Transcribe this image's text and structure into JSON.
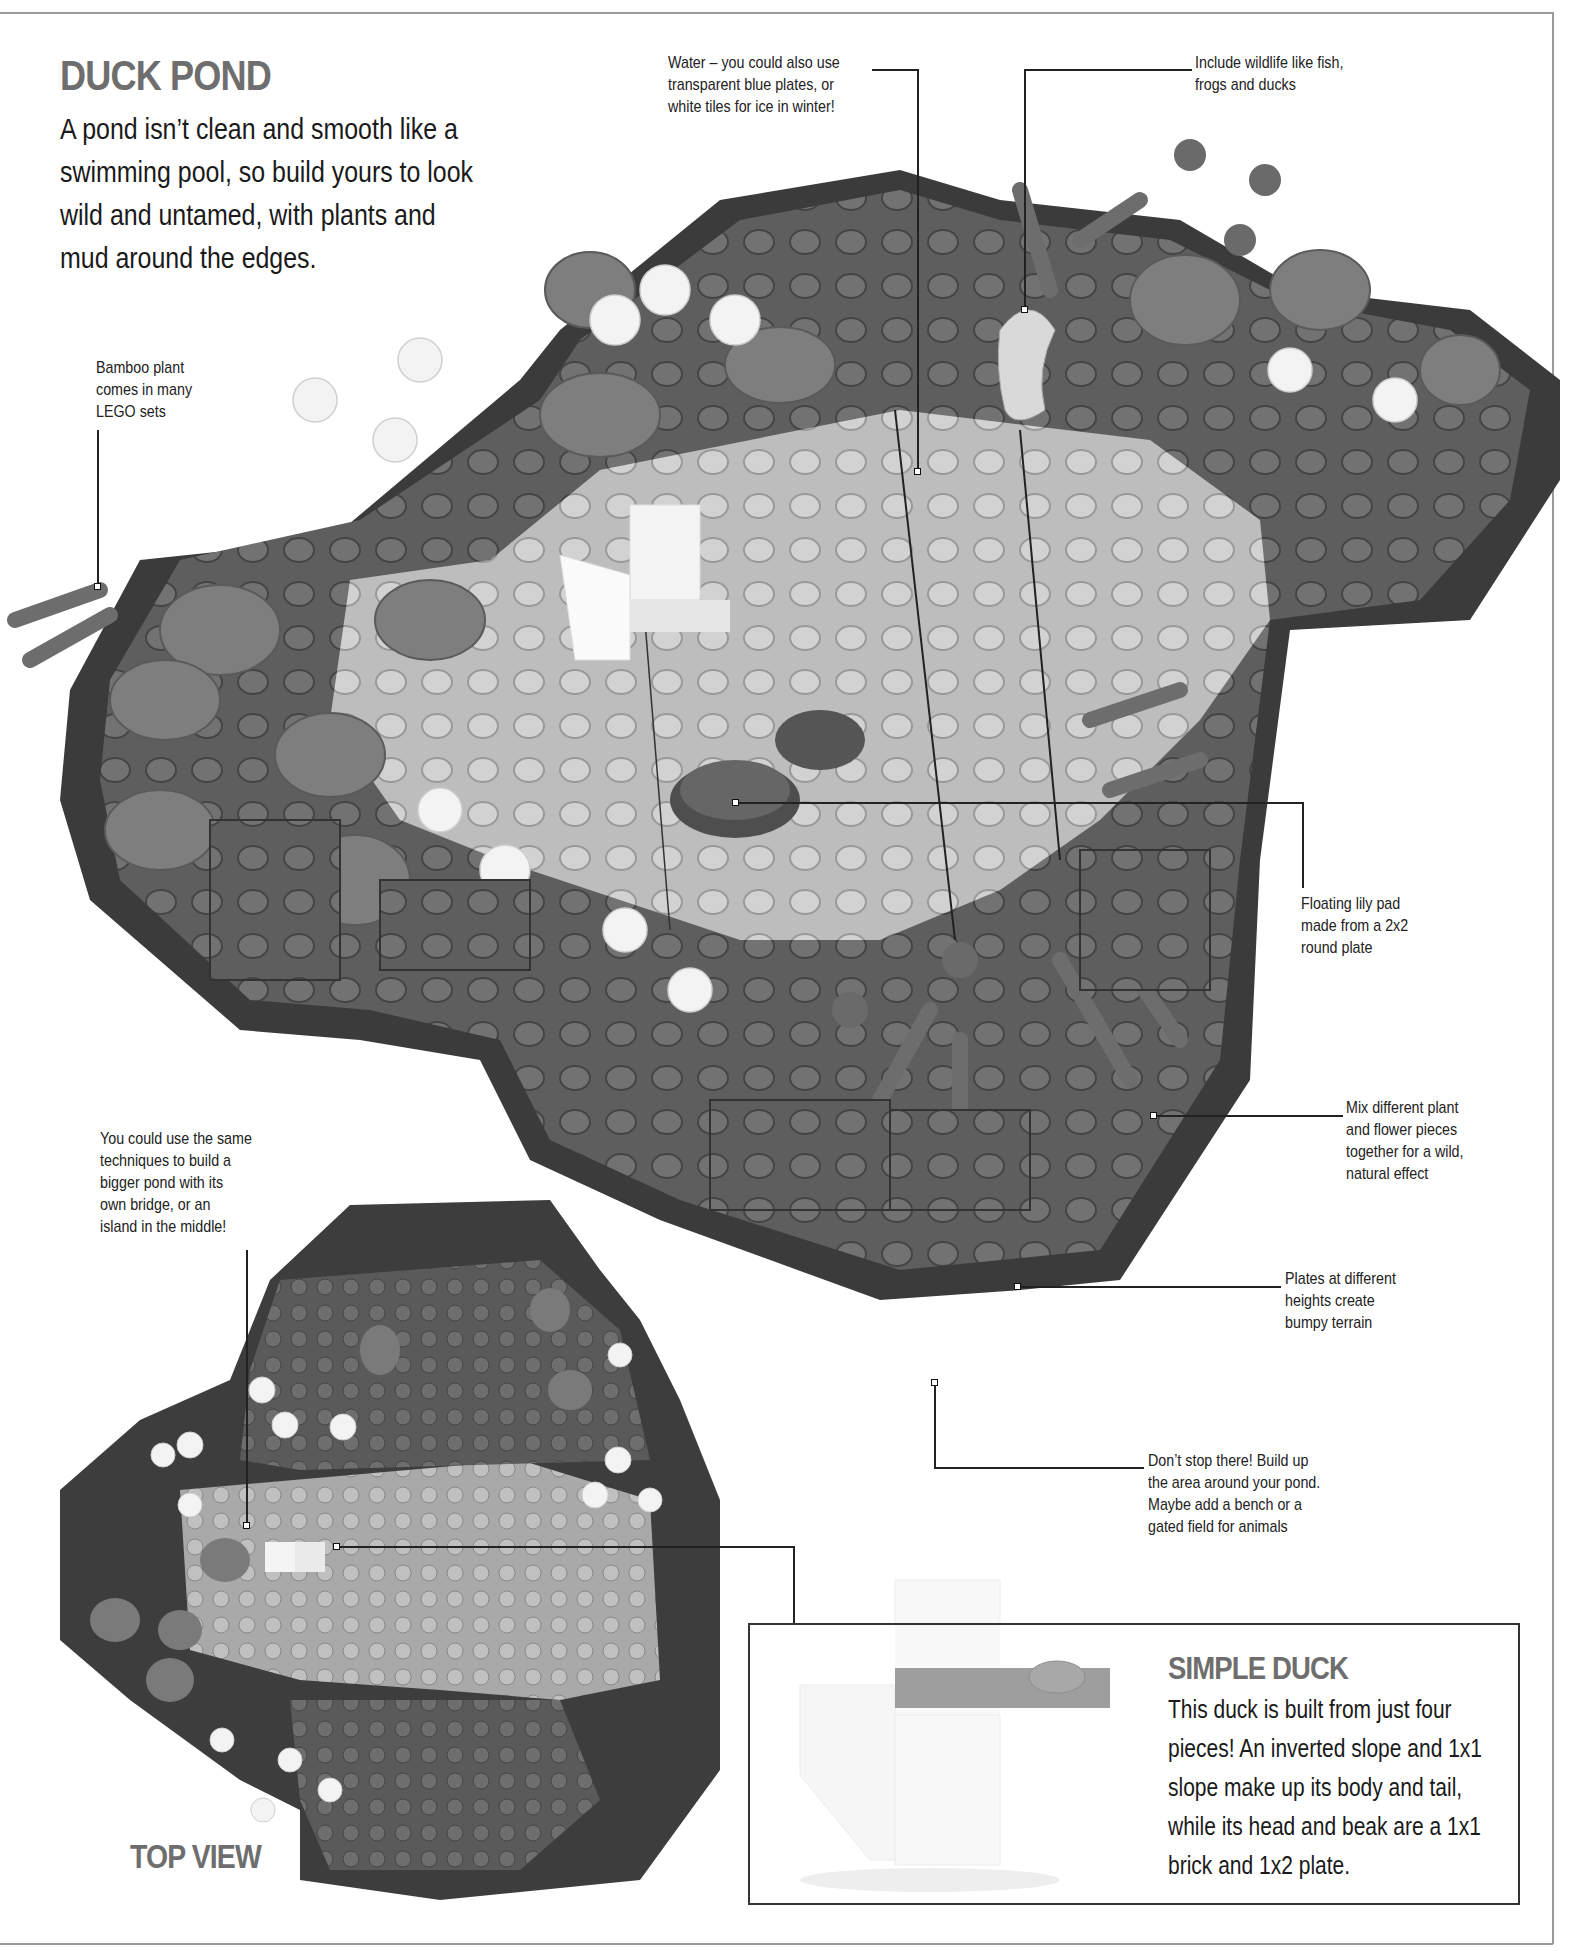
{
  "page": {
    "title": "DUCK POND",
    "intro_lines": [
      "A pond isn’t clean and smooth like a",
      "swimming pool, so build yours to look",
      "wild and untamed, with plants and",
      "mud around the edges."
    ]
  },
  "callouts": {
    "water": [
      "Water – you could also use",
      "transparent blue plates, or",
      "white tiles for ice in winter!"
    ],
    "wildlife": [
      "Include wildlife like fish,",
      "frogs and ducks"
    ],
    "bamboo": [
      "Bamboo plant",
      "comes in many",
      "LEGO sets"
    ],
    "lily_pad": [
      "Floating lily pad",
      "made from a 2x2",
      "round plate"
    ],
    "mix_plants": [
      "Mix different plant",
      "and flower pieces",
      "together for a wild,",
      "natural effect"
    ],
    "plates": [
      "Plates at different",
      "heights create",
      "bumpy terrain"
    ],
    "dont_stop": [
      "Don’t stop there! Build up",
      "the area around your pond.",
      "Maybe add a bench or a",
      "gated field for animals"
    ],
    "bigger_pond": [
      "You could use the same",
      "techniques to build a",
      "bigger pond with its",
      "own bridge, or an",
      "island in the middle!"
    ]
  },
  "top_view": {
    "label": "TOP VIEW"
  },
  "simple_duck": {
    "title": "SIMPLE DUCK",
    "body_lines": [
      "This duck is built from just four",
      "pieces! An inverted slope and 1x1",
      "slope make up its body and tail,",
      "while its head and beak are a 1x1",
      "brick and 1x2 plate."
    ]
  },
  "colors": {
    "title_gray": "#6e6e6e",
    "base_dark": "#3a3a3a",
    "terrain_mid": "#6b6b6b",
    "water_light": "#b9b9b9",
    "plant_gray": "#858585",
    "flower_white": "#f2f2f2",
    "border_gray": "#9a9a9a"
  }
}
